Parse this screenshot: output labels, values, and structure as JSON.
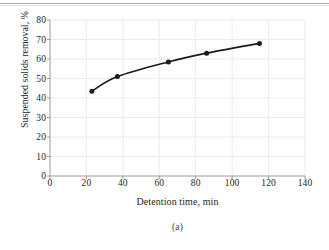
{
  "figure": {
    "caption": "(a)"
  },
  "chart_data": {
    "type": "line",
    "title": "",
    "subtitle": "",
    "xlabel": "Detention time, min",
    "ylabel": "Suspended solids removal, %",
    "xlim": [
      0,
      140
    ],
    "ylim": [
      0,
      80
    ],
    "xticks": [
      0,
      20,
      40,
      60,
      80,
      100,
      120,
      140
    ],
    "yticks": [
      0,
      10,
      20,
      30,
      40,
      50,
      60,
      70,
      80
    ],
    "xtick_labels": [
      "0",
      "20",
      "40",
      "60",
      "80",
      "100",
      "120",
      "140"
    ],
    "ytick_labels": [
      "0",
      "10",
      "20",
      "30",
      "40",
      "50",
      "60",
      "70",
      "80"
    ],
    "grid": true,
    "grid_color": "#ebebeb",
    "legend": null,
    "legend_position": "none",
    "annotations": [],
    "series": [
      {
        "name": "Suspended solids removal",
        "color": "#1a1a1a",
        "marker": "circle",
        "line_width": 1.6,
        "x": [
          23,
          37,
          65,
          86,
          115
        ],
        "y": [
          43.5,
          51.0,
          58.5,
          63.0,
          68.0
        ]
      }
    ]
  }
}
